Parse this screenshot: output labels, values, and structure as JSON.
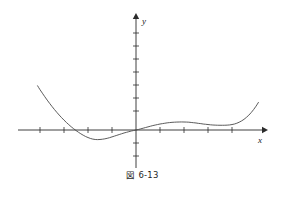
{
  "figure": {
    "caption": "図 6-13",
    "caption_label": "図",
    "caption_number": "6-13",
    "background_color": "#ffffff",
    "line_color": "#4a4a4a",
    "axis_color": "#2b2b2b"
  },
  "axes": {
    "x_label": "x",
    "y_label": "y",
    "x_axis": {
      "pixel_start": 18,
      "pixel_end": 265,
      "pixel_y": 130,
      "arrow": "right"
    },
    "y_axis": {
      "pixel_top": 15,
      "pixel_bottom": 168,
      "pixel_x": 136,
      "arrow": "up"
    },
    "x_ticks_px": [
      40,
      64,
      88,
      112,
      160,
      184,
      208,
      232
    ],
    "y_ticks_px": [
      33,
      46,
      59,
      72,
      85,
      98,
      111,
      124,
      143,
      156
    ]
  },
  "chart_data": {
    "type": "line",
    "title": "図 6-13",
    "xlabel": "x",
    "ylabel": "y",
    "grid": false,
    "legend": null,
    "xlim": [
      -4.9,
      5.4
    ],
    "ylim": [
      -1.9,
      3.1
    ],
    "x_tick_values": [
      -4,
      -3,
      -2,
      -1,
      1,
      2,
      3,
      4
    ],
    "y_tick_values": [
      -1,
      1,
      2,
      3
    ],
    "annotations": [],
    "series": [
      {
        "name": "curve",
        "description": "quartic-like curve: steep fall from upper left, global minimum near x=-1.7, passes through the origin, local maximum near x=1.9, local minimum near x=3.7, steep rise to upper right",
        "points": [
          [
            -4.1,
            3.4
          ],
          [
            -4.0,
            3.1
          ],
          [
            -3.9,
            2.83
          ],
          [
            -3.8,
            2.56
          ],
          [
            -3.7,
            2.3
          ],
          [
            -3.6,
            2.05
          ],
          [
            -3.5,
            1.81
          ],
          [
            -3.4,
            1.58
          ],
          [
            -3.3,
            1.36
          ],
          [
            -3.2,
            1.15
          ],
          [
            -3.1,
            0.95
          ],
          [
            -3.0,
            0.76
          ],
          [
            -2.9,
            0.58
          ],
          [
            -2.8,
            0.41
          ],
          [
            -2.7,
            0.25
          ],
          [
            -2.6,
            0.1
          ],
          [
            -2.5,
            -0.04
          ],
          [
            -2.4,
            -0.17
          ],
          [
            -2.3,
            -0.29
          ],
          [
            -2.2,
            -0.4
          ],
          [
            -2.1,
            -0.5
          ],
          [
            -2.0,
            -0.58
          ],
          [
            -1.9,
            -0.65
          ],
          [
            -1.8,
            -0.7
          ],
          [
            -1.7,
            -0.73
          ],
          [
            -1.6,
            -0.74
          ],
          [
            -1.5,
            -0.73
          ],
          [
            -1.4,
            -0.71
          ],
          [
            -1.3,
            -0.68
          ],
          [
            -1.2,
            -0.64
          ],
          [
            -1.1,
            -0.59
          ],
          [
            -1.0,
            -0.53
          ],
          [
            -0.9,
            -0.47
          ],
          [
            -0.8,
            -0.41
          ],
          [
            -0.7,
            -0.35
          ],
          [
            -0.6,
            -0.29
          ],
          [
            -0.5,
            -0.23
          ],
          [
            -0.4,
            -0.18
          ],
          [
            -0.3,
            -0.13
          ],
          [
            -0.2,
            -0.08
          ],
          [
            -0.1,
            -0.04
          ],
          [
            0.0,
            0.0
          ],
          [
            0.1,
            0.04
          ],
          [
            0.2,
            0.09
          ],
          [
            0.3,
            0.14
          ],
          [
            0.4,
            0.19
          ],
          [
            0.5,
            0.24
          ],
          [
            0.6,
            0.29
          ],
          [
            0.7,
            0.34
          ],
          [
            0.8,
            0.38
          ],
          [
            0.9,
            0.42
          ],
          [
            1.0,
            0.46
          ],
          [
            1.1,
            0.49
          ],
          [
            1.2,
            0.52
          ],
          [
            1.3,
            0.55
          ],
          [
            1.4,
            0.57
          ],
          [
            1.5,
            0.59
          ],
          [
            1.6,
            0.6
          ],
          [
            1.7,
            0.61
          ],
          [
            1.8,
            0.615
          ],
          [
            1.9,
            0.62
          ],
          [
            2.0,
            0.615
          ],
          [
            2.1,
            0.61
          ],
          [
            2.2,
            0.6
          ],
          [
            2.3,
            0.58
          ],
          [
            2.4,
            0.56
          ],
          [
            2.5,
            0.54
          ],
          [
            2.6,
            0.51
          ],
          [
            2.7,
            0.49
          ],
          [
            2.8,
            0.46
          ],
          [
            2.9,
            0.44
          ],
          [
            3.0,
            0.42
          ],
          [
            3.1,
            0.4
          ],
          [
            3.2,
            0.385
          ],
          [
            3.3,
            0.375
          ],
          [
            3.4,
            0.368
          ],
          [
            3.5,
            0.365
          ],
          [
            3.6,
            0.364
          ],
          [
            3.7,
            0.366
          ],
          [
            3.8,
            0.375
          ],
          [
            3.9,
            0.39
          ],
          [
            4.0,
            0.42
          ],
          [
            4.1,
            0.46
          ],
          [
            4.2,
            0.52
          ],
          [
            4.3,
            0.6
          ],
          [
            4.4,
            0.7
          ],
          [
            4.5,
            0.82
          ],
          [
            4.6,
            0.97
          ],
          [
            4.7,
            1.14
          ],
          [
            4.8,
            1.34
          ],
          [
            4.9,
            1.57
          ],
          [
            5.0,
            1.83
          ],
          [
            5.1,
            2.12
          ]
        ]
      }
    ]
  }
}
